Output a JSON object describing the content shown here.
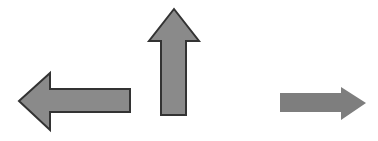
{
  "scene": {
    "title": "Three gray directional arrows",
    "width": 378,
    "height": 141,
    "background_color": "#ffffff"
  },
  "arrows": [
    {
      "name": "left-arrow",
      "direction": "left",
      "label": "Left arrow",
      "fill_color": "#8a8a8a",
      "stroke_color": "#333333",
      "stroke_width": 2,
      "outlined": true,
      "points": "19,101 50,73 50,89 130,89 130,112 50,112 50,130",
      "bbox": {
        "x": 19,
        "y": 73,
        "width": 111,
        "height": 57
      }
    },
    {
      "name": "up-arrow",
      "direction": "up",
      "label": "Up arrow",
      "fill_color": "#8a8a8a",
      "stroke_color": "#333333",
      "stroke_width": 2,
      "outlined": true,
      "points": "174,9 199,41 186,41 186,115 161,115 161,41 149,41",
      "bbox": {
        "x": 149,
        "y": 9,
        "width": 50,
        "height": 106
      }
    },
    {
      "name": "right-arrow",
      "direction": "right",
      "label": "Right arrow",
      "fill_color": "#7e7e7e",
      "stroke_color": "none",
      "stroke_width": 0,
      "outlined": false,
      "points": "280,93 341,93 341,87 366,103 341,120 341,112 280,112",
      "bbox": {
        "x": 280,
        "y": 87,
        "width": 86,
        "height": 33
      }
    }
  ]
}
